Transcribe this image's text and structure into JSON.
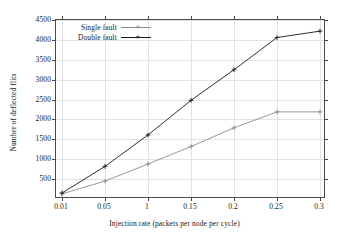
{
  "chart_data": {
    "type": "line",
    "title": "",
    "xlabel": "Injection rate (packets per node per cycle)",
    "ylabel": "Number of deflected flits",
    "categories": [
      "0.01",
      "0.05",
      "1",
      "0.15",
      "0.2",
      "0.25",
      "0.3"
    ],
    "x_tick_labels": [
      "0.01",
      "0.05",
      "1",
      "0.15",
      "0.2",
      "0.25",
      "0.3"
    ],
    "y_tick_labels": [
      "500",
      "1000",
      "1500",
      "2000",
      "2500",
      "3000",
      "3500",
      "4000",
      "4500"
    ],
    "y_ticks": [
      500,
      1000,
      1500,
      2000,
      2500,
      3000,
      3500,
      4000,
      4500
    ],
    "ylim": [
      0,
      4500
    ],
    "grid": true,
    "legend_position": "top-left-inside",
    "marker": "plus",
    "series": [
      {
        "name": "Single fault",
        "color": "#8c8c8c",
        "values": [
          130,
          450,
          880,
          1320,
          1790,
          2190,
          2190
        ]
      },
      {
        "name": "Double fault",
        "color": "#1a1a1a",
        "values": [
          150,
          820,
          1610,
          2480,
          3250,
          4060,
          4220
        ]
      }
    ]
  },
  "legend": {
    "items": [
      {
        "label": "Single fault"
      },
      {
        "label": "Double fault"
      }
    ]
  },
  "colors": {
    "single_fault": "#8c8c8c",
    "double_fault": "#1a1a1a",
    "frame": "#4a4a4a",
    "grid": "#e2e2e2",
    "background": "#ffffff"
  }
}
